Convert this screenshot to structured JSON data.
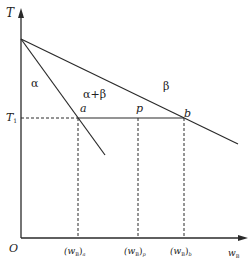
{
  "diagram": {
    "type": "phase-diagram-lever-rule",
    "axes": {
      "y_label": "T",
      "x_label_main": "w",
      "x_label_sub": "B",
      "origin_label": "O"
    },
    "temperature_line": {
      "label_main": "T",
      "label_sub": "1"
    },
    "regions": {
      "alpha": "α",
      "alpha_beta": "α+β",
      "beta": "β"
    },
    "points": {
      "a": "a",
      "p": "p",
      "b": "b"
    },
    "x_ticks": [
      {
        "paren": "(w",
        "sub": "B",
        "close": ")",
        "subscript2": "a"
      },
      {
        "paren": "(w",
        "sub": "B",
        "close": ")",
        "subscript2": "p"
      },
      {
        "paren": "(w",
        "sub": "B",
        "close": ")",
        "subscript2": "b"
      }
    ],
    "colors": {
      "line": "#2a2a2a",
      "background": "#ffffff"
    }
  }
}
